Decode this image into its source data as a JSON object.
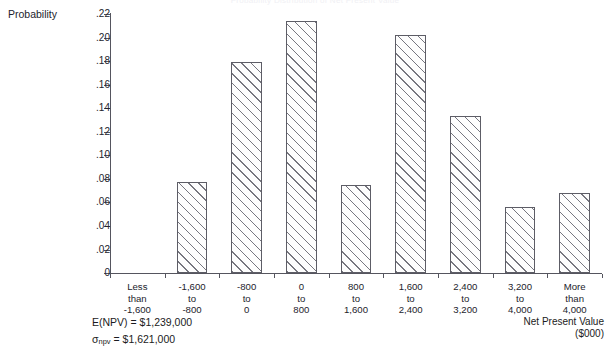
{
  "chart_data": {
    "type": "bar",
    "title": "Probability Distribution of Net Present Value",
    "ylabel": "Probability",
    "xlabel": "Net Present Value\n($000)",
    "ylim": [
      0,
      0.22
    ],
    "ytick_labels": [
      ".22",
      ".20",
      ".18",
      ".16",
      ".14",
      ".12",
      ".10",
      ".08",
      ".06",
      ".04",
      ".02",
      "0"
    ],
    "ytick_values": [
      0.22,
      0.2,
      0.18,
      0.16,
      0.14,
      0.12,
      0.1,
      0.08,
      0.06,
      0.04,
      0.02,
      0
    ],
    "grid": false,
    "legend": false,
    "categories": [
      "Less\nthan\n-1,600",
      "-1,600\nto\n-800",
      "-800\nto\n0",
      "0\nto\n800",
      "800\nto\n1,600",
      "1,600\nto\n2,400",
      "2,400\nto\n3,200",
      "3,200\nto\n4,000",
      "More\nthan\n4,000"
    ],
    "values": [
      0.0,
      0.077,
      0.179,
      0.214,
      0.0745,
      0.202,
      0.133,
      0.056,
      0.068
    ],
    "annotations": [
      "E(NPV) = $1,239,000",
      "σnpv = $1,621,000"
    ]
  },
  "stats": {
    "mean_prefix": "E(NPV) = ",
    "mean_value": "$1,239,000",
    "sd_symbol": "σ",
    "sd_subscript": "npv",
    "sd_prefix": " = ",
    "sd_value": "$1,621,000"
  },
  "colors": {
    "axis": "#55555e",
    "bar_outline": "#5d5d66",
    "bar_fill": "#fdfdfd",
    "hatch": "#5f5f69",
    "text": "#1b1b22"
  }
}
